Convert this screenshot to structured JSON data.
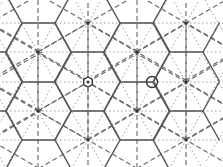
{
  "diagram": {
    "type": "wallpaper-symmetry-lattice",
    "width": 223,
    "height": 167,
    "colors": {
      "background": "#ffffff",
      "solid": "#555555",
      "dashed": "#666666",
      "dotted": "#999999",
      "marker": "#333333"
    },
    "rows_y": [
      23,
      52,
      82,
      111,
      140
    ],
    "period_x": 98,
    "hex_half_width": 16.5,
    "even_rows": {
      "ys": [
        23,
        82,
        140
      ],
      "centers_x": [
        -10,
        88,
        186
      ],
      "solid_segments_x": [
        [
          22,
          55
        ],
        [
          120,
          153
        ]
      ]
    },
    "odd_rows": {
      "ys": [
        52,
        111
      ],
      "centers_x": [
        38,
        137,
        235
      ],
      "solid_segments_x": [
        [
          -27,
          6
        ],
        [
          71,
          104
        ],
        [
          170,
          203
        ]
      ]
    },
    "markers": [
      {
        "name": "hexagon-rotation-marker",
        "x": 88,
        "y": 82,
        "shape": "hexagon"
      },
      {
        "name": "circle-rotation-marker",
        "x": 152,
        "y": 82,
        "shape": "circle"
      }
    ]
  }
}
